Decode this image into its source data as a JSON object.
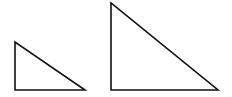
{
  "diagram": {
    "stroke_color": "#111111",
    "background": "#ffffff",
    "shapes": [
      {
        "name": "small-triangle",
        "type": "right-triangle",
        "points": "15,42 15,90 85,90"
      },
      {
        "name": "large-triangle",
        "type": "right-triangle",
        "points": "111,3 111,90 218,90"
      }
    ]
  }
}
